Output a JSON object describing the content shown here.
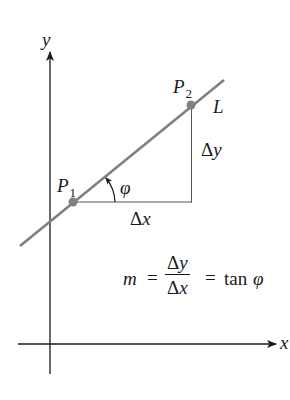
{
  "diagram": {
    "axes": {
      "x_label": "x",
      "y_label": "y"
    },
    "line": {
      "label": "L",
      "color": "#808080"
    },
    "points": [
      {
        "name": "P",
        "subscript": "1"
      },
      {
        "name": "P",
        "subscript": "2"
      }
    ],
    "angle_label": "φ",
    "delta_x": {
      "delta": "Δ",
      "var": "x"
    },
    "delta_y": {
      "delta": "Δ",
      "var": "y"
    },
    "formula": {
      "lhs": "m",
      "eq1": "=",
      "numerator_delta": "Δ",
      "numerator_var": "y",
      "denominator_delta": "Δ",
      "denominator_var": "x",
      "eq2": "=",
      "rhs_func": "tan",
      "rhs_var": "φ"
    },
    "colors": {
      "axes": "#1a1a1a",
      "line": "#808080",
      "point": "#808080",
      "triangle": "#555555"
    }
  }
}
